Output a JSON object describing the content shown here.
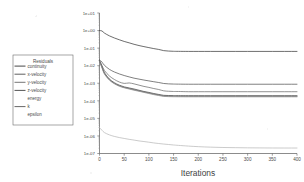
{
  "figure": {
    "kind": "residuals-plot",
    "background": "#ffffff",
    "ink": "#4a4a4a"
  },
  "legend": {
    "title": "Residuals",
    "box": {
      "x": 13,
      "y": 55,
      "w": 60,
      "h": 70
    },
    "items": [
      {
        "label": "continuity",
        "color": "#3d3d3d",
        "swatch": true
      },
      {
        "label": "x-velocity",
        "color": "#555555",
        "swatch": true
      },
      {
        "label": "y-velocity",
        "color": "#6e6e6e",
        "swatch": true
      },
      {
        "label": "z-velocity",
        "color": "#4a4a4a",
        "swatch": true
      },
      {
        "label": "energy",
        "color": "#b9b9b9",
        "swatch": false
      },
      {
        "label": "k",
        "color": "#5f5f5f",
        "swatch": true
      },
      {
        "label": "epsilon",
        "color": "#8a8a8a",
        "swatch": false
      }
    ]
  },
  "chart_data": {
    "type": "line",
    "title": "",
    "xlabel": "Iterations",
    "ylabel": "",
    "yscale": "log",
    "xlim": [
      0,
      400
    ],
    "ylim": [
      1e-07,
      10.0
    ],
    "grid": false,
    "legend_position": "left-outside",
    "xticks": [
      0,
      50,
      100,
      150,
      200,
      250,
      300,
      350,
      400
    ],
    "xticklabels": [
      "0",
      "50",
      "100",
      "150",
      "200",
      "250",
      "300",
      "350",
      "400"
    ],
    "yticks": [
      10.0,
      1.0,
      0.1,
      0.01,
      0.001,
      0.0001,
      1e-05,
      1e-06,
      1e-07
    ],
    "yticklabels": [
      "1e+01",
      "1e+00",
      "1e-01",
      "1e-02",
      "1e-03",
      "1e-04",
      "1e-05",
      "1e-06",
      "1e-07"
    ],
    "x": [
      0,
      5,
      10,
      20,
      30,
      40,
      50,
      60,
      70,
      80,
      90,
      100,
      110,
      120,
      130,
      140,
      150,
      160,
      180,
      200,
      225,
      250,
      275,
      300,
      325,
      350,
      375,
      400
    ],
    "series": [
      {
        "name": "continuity",
        "color": "#3d3d3d",
        "values": [
          1.0,
          0.95,
          0.72,
          0.5,
          0.38,
          0.3,
          0.24,
          0.2,
          0.165,
          0.14,
          0.122,
          0.107,
          0.094,
          0.084,
          0.072,
          0.068,
          0.066,
          0.0655,
          0.065,
          0.065,
          0.065,
          0.065,
          0.065,
          0.065,
          0.065,
          0.065,
          0.065,
          0.065
        ]
      },
      {
        "name": "x-velocity",
        "color": "#555555",
        "values": [
          0.022,
          0.016,
          0.0105,
          0.0062,
          0.0044,
          0.0034,
          0.00275,
          0.0023,
          0.00195,
          0.00172,
          0.00152,
          0.00136,
          0.00122,
          0.0011,
          0.00097,
          0.00092,
          0.0009,
          0.00089,
          0.00088,
          0.00088,
          0.00088,
          0.00088,
          0.00088,
          0.00088,
          0.00088,
          0.00088,
          0.00088,
          0.00088
        ]
      },
      {
        "name": "y-velocity",
        "color": "#6e6e6e",
        "values": [
          0.02,
          0.0105,
          0.0053,
          0.0026,
          0.00165,
          0.00118,
          0.00098,
          0.00104,
          0.00092,
          0.00078,
          0.00066,
          0.00058,
          0.0005,
          0.00044,
          0.00037,
          0.00035,
          0.00034,
          0.00034,
          0.00033,
          0.00033,
          0.00033,
          0.00033,
          0.00033,
          0.00033,
          0.00033,
          0.00033,
          0.00033,
          0.00033
        ]
      },
      {
        "name": "z-velocity",
        "color": "#4a4a4a",
        "values": [
          0.019,
          0.0088,
          0.004,
          0.00175,
          0.00108,
          0.00078,
          0.00062,
          0.00054,
          0.00047,
          0.0004,
          0.00034,
          0.0003,
          0.00026,
          0.00023,
          0.000205,
          0.0002,
          0.000198,
          0.000197,
          0.000196,
          0.000196,
          0.000196,
          0.000196,
          0.000196,
          0.000196,
          0.000196,
          0.000196,
          0.000196,
          0.000196
        ]
      },
      {
        "name": "energy",
        "color": "#b9b9b9",
        "values": [
          3e-06,
          2.1e-06,
          1.55e-06,
          1.15e-06,
          9.4e-07,
          8.1e-07,
          7.2e-07,
          6.4e-07,
          5.8e-07,
          5.2e-07,
          4.8e-07,
          4.4e-07,
          4e-07,
          3.7e-07,
          3.45e-07,
          3.25e-07,
          3.05e-07,
          2.9e-07,
          2.65e-07,
          2.45e-07,
          2.3e-07,
          2.2e-07,
          2.15e-07,
          2.1e-07,
          2.08e-07,
          2.06e-07,
          2.05e-07,
          2.05e-07
        ]
      },
      {
        "name": "k",
        "color": "#5f5f5f",
        "values": [
          0.0185,
          0.0082,
          0.0036,
          0.0016,
          0.001,
          0.00072,
          0.00058,
          0.0005,
          0.00043,
          0.00037,
          0.00032,
          0.00028,
          0.00024,
          0.000215,
          0.00019,
          0.000185,
          0.000183,
          0.000182,
          0.000181,
          0.000181,
          0.000181,
          0.000181,
          0.000181,
          0.000181,
          0.000181,
          0.000181,
          0.000181,
          0.000181
        ]
      },
      {
        "name": "epsilon",
        "color": "#8a8a8a",
        "values": [
          0.017,
          0.0076,
          0.0033,
          0.0015,
          0.00094,
          0.00068,
          0.00055,
          0.00047,
          0.0004,
          0.00035,
          0.0003,
          0.00026,
          0.000225,
          0.0002,
          0.000178,
          0.000173,
          0.000171,
          0.00017,
          0.000169,
          0.000169,
          0.000169,
          0.000169,
          0.000169,
          0.000169,
          0.000169,
          0.000169,
          0.000169,
          0.000169
        ]
      }
    ]
  }
}
